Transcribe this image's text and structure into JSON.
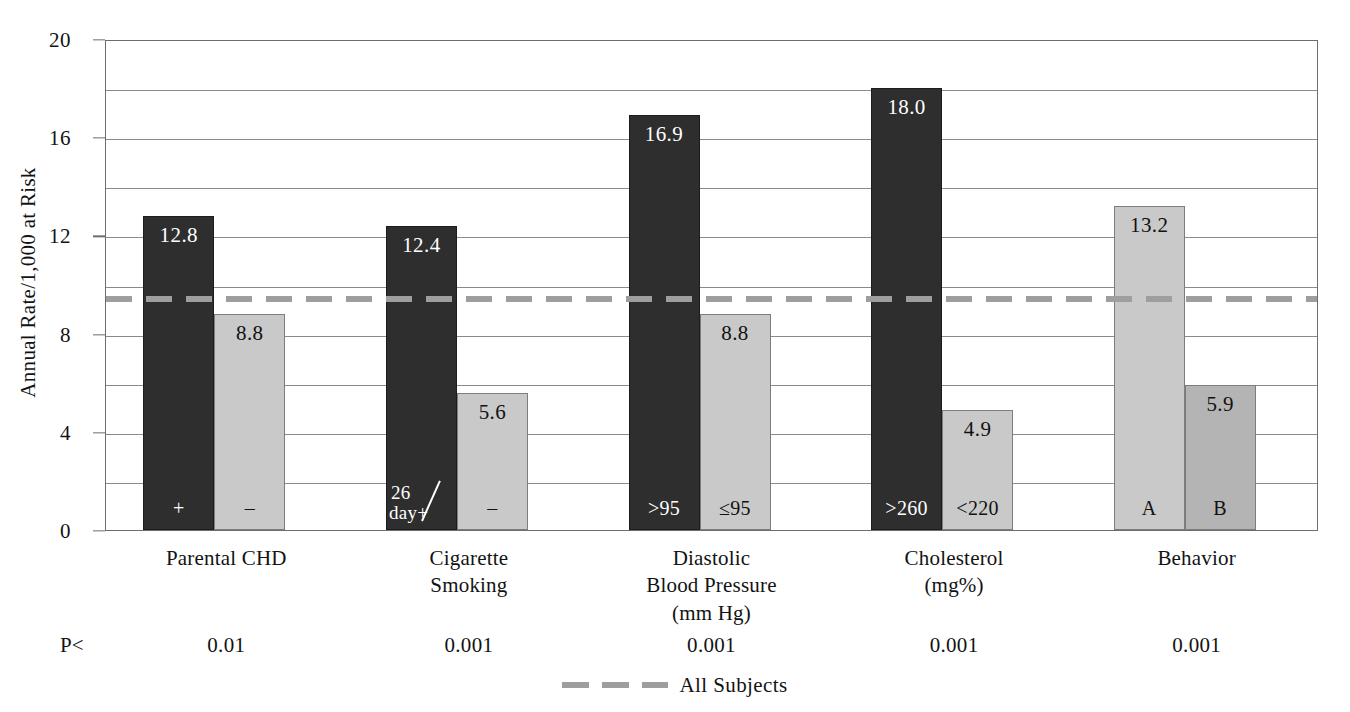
{
  "chart_data": {
    "type": "bar",
    "title": "",
    "xlabel": "",
    "ylabel": "Annual Rate/1,000 at Risk",
    "ylim": [
      0,
      20
    ],
    "ytick_labels": [
      "0",
      "4",
      "8",
      "12",
      "16",
      "20"
    ],
    "ytick_values": [
      0,
      4,
      8,
      12,
      16,
      20
    ],
    "gridlines": [
      2,
      4,
      6,
      8,
      10,
      12,
      14,
      16,
      18,
      20
    ],
    "grid": true,
    "legend_position": "bottom-center",
    "categories": [
      "Parental CHD",
      "Cigarette Smoking",
      "Diastolic Blood Pressure (mm Hg)",
      "Cholesterol (mg%)",
      "Behavior"
    ],
    "groups": [
      {
        "label_lines": [
          "Parental CHD"
        ],
        "p_value": "0.01",
        "bars": [
          {
            "value": 12.8,
            "value_label": "12.8",
            "category": "+",
            "shade": "dark"
          },
          {
            "value": 8.8,
            "value_label": "8.8",
            "category": "–",
            "shade": "light"
          }
        ]
      },
      {
        "label_lines": [
          "Cigarette",
          "Smoking"
        ],
        "p_value": "0.001",
        "bars": [
          {
            "value": 12.4,
            "value_label": "12.4",
            "category": "26/day+",
            "category_top": "26",
            "category_bottom": "day+",
            "shade": "dark"
          },
          {
            "value": 5.6,
            "value_label": "5.6",
            "category": "–",
            "shade": "light"
          }
        ]
      },
      {
        "label_lines": [
          "Diastolic",
          "Blood Pressure",
          "(mm Hg)"
        ],
        "p_value": "0.001",
        "bars": [
          {
            "value": 16.9,
            "value_label": "16.9",
            "category": ">95",
            "shade": "dark"
          },
          {
            "value": 8.8,
            "value_label": "8.8",
            "category": "≤95",
            "shade": "light"
          }
        ]
      },
      {
        "label_lines": [
          "Cholesterol",
          "(mg%)"
        ],
        "p_value": "0.001",
        "bars": [
          {
            "value": 18.0,
            "value_label": "18.0",
            "category": ">260",
            "shade": "dark"
          },
          {
            "value": 4.9,
            "value_label": "4.9",
            "category": "<220",
            "shade": "light"
          }
        ]
      },
      {
        "label_lines": [
          "Behavior"
        ],
        "p_value": "0.001",
        "bars": [
          {
            "value": 13.2,
            "value_label": "13.2",
            "category": "A",
            "shade": "light"
          },
          {
            "value": 5.9,
            "value_label": "5.9",
            "category": "B",
            "shade": "light2"
          }
        ]
      }
    ],
    "reference_line": {
      "label": "All Subjects",
      "value": 9.5,
      "style": "dashed",
      "color": "#9e9e9e"
    },
    "annotations": {
      "p_label": "P<"
    }
  },
  "colors": {
    "bar_dark": "#2e2e2e",
    "bar_light": "#c9c9c9",
    "bar_light_alt": "#b4b4b4",
    "grid": "#8a8a8a",
    "axis": "#6d6d6d",
    "reference": "#9e9e9e",
    "text": "#131313",
    "background": "#ffffff"
  }
}
